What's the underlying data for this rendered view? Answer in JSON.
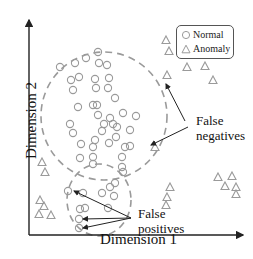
{
  "figure": {
    "x_axis_label": "Dimension 1",
    "y_axis_label": "Dimension 2"
  },
  "legend": {
    "items": [
      {
        "label": "Normal",
        "marker": "circle-icon"
      },
      {
        "label": "Anomaly",
        "marker": "triangle-icon"
      }
    ]
  },
  "annotations": {
    "false_negatives": [
      "False",
      "negatives"
    ],
    "false_positives": [
      "False",
      "positives"
    ]
  },
  "colors": {
    "marker": "#9a9a9a",
    "cluster_boundary": "#9a9a9a",
    "axis": "#222222",
    "arrow": "#222222"
  },
  "points": {
    "normal": [
      [
        60,
        67
      ],
      [
        75,
        63
      ],
      [
        86,
        58
      ],
      [
        98,
        52
      ],
      [
        99,
        63
      ],
      [
        107,
        65
      ],
      [
        71,
        80
      ],
      [
        79,
        77
      ],
      [
        95,
        79
      ],
      [
        109,
        78
      ],
      [
        73,
        90
      ],
      [
        96,
        88
      ],
      [
        108,
        88
      ],
      [
        78,
        107
      ],
      [
        93,
        105
      ],
      [
        97,
        105
      ],
      [
        115,
        98
      ],
      [
        123,
        113
      ],
      [
        98,
        115
      ],
      [
        110,
        118
      ],
      [
        70,
        124
      ],
      [
        104,
        124
      ],
      [
        113,
        124
      ],
      [
        136,
        116
      ],
      [
        73,
        133
      ],
      [
        81,
        144
      ],
      [
        95,
        140
      ],
      [
        102,
        131
      ],
      [
        109,
        143
      ],
      [
        116,
        137
      ],
      [
        117,
        127
      ],
      [
        125,
        147
      ],
      [
        130,
        130
      ],
      [
        130,
        146
      ],
      [
        93,
        147
      ],
      [
        93,
        157
      ],
      [
        93,
        164
      ],
      [
        80,
        158
      ],
      [
        122,
        157
      ],
      [
        123,
        172
      ],
      [
        83,
        193
      ],
      [
        102,
        193
      ],
      [
        110,
        187
      ],
      [
        115,
        183
      ],
      [
        114,
        196
      ],
      [
        122,
        167
      ],
      [
        108,
        208
      ],
      [
        85,
        208
      ],
      [
        68,
        191
      ],
      [
        80,
        209
      ],
      [
        79,
        219
      ],
      [
        79,
        228
      ]
    ],
    "anomaly": [
      [
        166,
        40
      ],
      [
        169,
        51
      ],
      [
        187,
        67
      ],
      [
        205,
        66
      ],
      [
        213,
        80
      ],
      [
        167,
        75
      ],
      [
        155,
        147
      ],
      [
        42,
        162
      ],
      [
        45,
        172
      ],
      [
        40,
        200
      ],
      [
        44,
        206
      ],
      [
        39,
        214
      ],
      [
        51,
        215
      ],
      [
        218,
        177
      ],
      [
        232,
        176
      ],
      [
        225,
        186
      ],
      [
        236,
        187
      ],
      [
        236,
        194
      ],
      [
        170,
        187
      ],
      [
        167,
        197
      ],
      [
        166,
        205
      ]
    ]
  }
}
